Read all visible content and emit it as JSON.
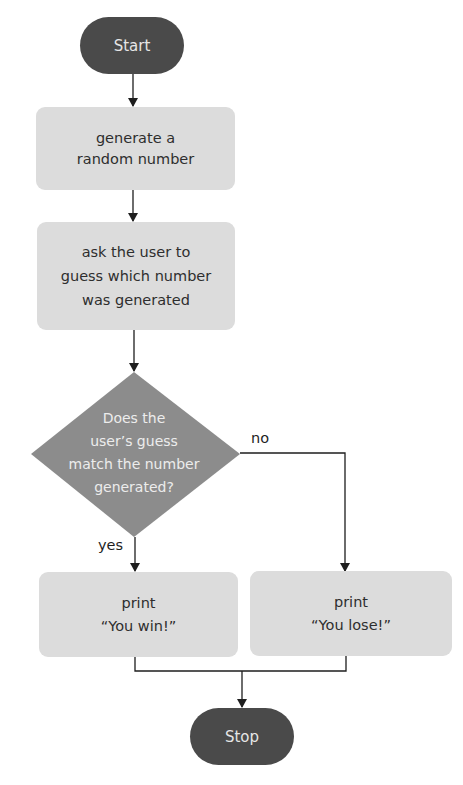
{
  "flowchart": {
    "colors": {
      "terminal_fill": "#4a4a4a",
      "terminal_text": "#e6e6e6",
      "process_fill": "#dcdcdc",
      "process_text": "#2e2e2e",
      "decision_fill": "#8c8c8c",
      "decision_text": "#ececec",
      "connector": "#1e1e1e"
    },
    "start": {
      "label": "Start"
    },
    "generate": {
      "lines": [
        "generate a",
        "random number"
      ]
    },
    "ask": {
      "lines": [
        "ask the user to",
        "guess which number",
        "was generated"
      ]
    },
    "decision": {
      "lines": [
        "Does the",
        "user’s guess",
        "match the number",
        "generated?"
      ]
    },
    "branch_yes": {
      "label": "yes"
    },
    "branch_no": {
      "label": "no"
    },
    "win": {
      "lines": [
        "print",
        "“You win!”"
      ]
    },
    "lose": {
      "lines": [
        "print",
        "“You lose!”"
      ]
    },
    "stop": {
      "label": "Stop"
    }
  }
}
